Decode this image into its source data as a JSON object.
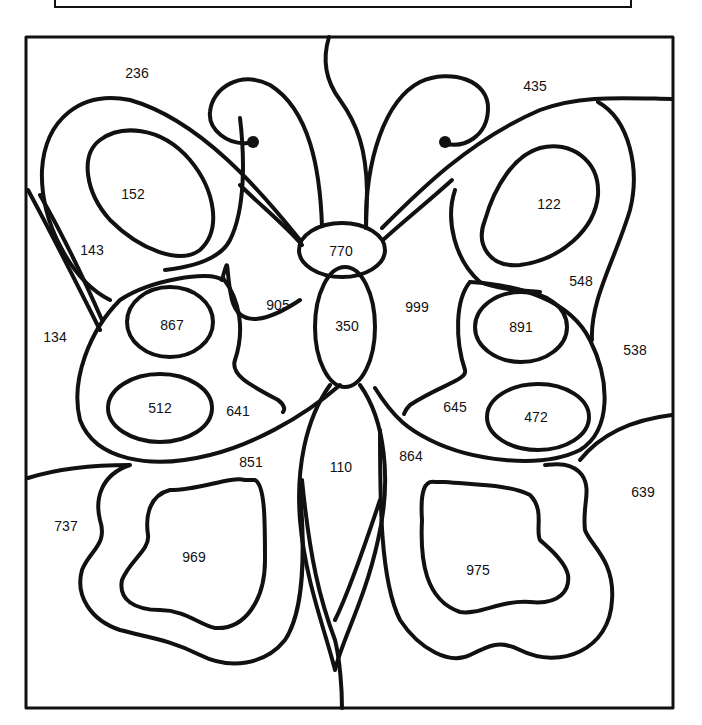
{
  "page": {
    "kind": "color-by-number worksheet"
  },
  "colors": {
    "line": "#111111",
    "background": "#ffffff"
  },
  "regions": [
    {
      "id": "r236",
      "label": "236",
      "area": "background-top-left",
      "x": 137,
      "y": 73
    },
    {
      "id": "r435",
      "label": "435",
      "area": "background-top-right",
      "x": 535,
      "y": 86
    },
    {
      "id": "r152",
      "label": "152",
      "area": "left-upper-wing-inner-oval",
      "x": 133,
      "y": 194
    },
    {
      "id": "r122",
      "label": "122",
      "area": "right-upper-wing-inner-oval",
      "x": 549,
      "y": 204
    },
    {
      "id": "r143",
      "label": "143",
      "area": "left-upper-wing-band",
      "x": 92,
      "y": 250
    },
    {
      "id": "r770",
      "label": "770",
      "area": "head",
      "x": 341,
      "y": 251
    },
    {
      "id": "r548",
      "label": "548",
      "area": "right-upper-wing-band",
      "x": 581,
      "y": 281
    },
    {
      "id": "r905",
      "label": "905",
      "area": "background-left-of-body",
      "x": 278,
      "y": 305
    },
    {
      "id": "r999",
      "label": "999",
      "area": "background-right-of-body",
      "x": 417,
      "y": 307
    },
    {
      "id": "r134",
      "label": "134",
      "area": "background-left-edge",
      "x": 55,
      "y": 337
    },
    {
      "id": "r867",
      "label": "867",
      "area": "left-lower-wing-top-oval",
      "x": 172,
      "y": 325
    },
    {
      "id": "r350",
      "label": "350",
      "area": "thorax",
      "x": 347,
      "y": 326
    },
    {
      "id": "r891",
      "label": "891",
      "area": "right-lower-wing-top-oval",
      "x": 521,
      "y": 327
    },
    {
      "id": "r538",
      "label": "538",
      "area": "background-right-edge",
      "x": 635,
      "y": 350
    },
    {
      "id": "r512",
      "label": "512",
      "area": "left-lower-wing-bottom-oval",
      "x": 160,
      "y": 408
    },
    {
      "id": "r641",
      "label": "641",
      "area": "left-lower-wing-band",
      "x": 238,
      "y": 411
    },
    {
      "id": "r645",
      "label": "645",
      "area": "right-lower-wing-band",
      "x": 455,
      "y": 407
    },
    {
      "id": "r472",
      "label": "472",
      "area": "right-lower-wing-bottom-oval",
      "x": 536,
      "y": 417
    },
    {
      "id": "r851",
      "label": "851",
      "area": "left-tail-wing-band",
      "x": 251,
      "y": 462
    },
    {
      "id": "r110",
      "label": "110",
      "area": "abdomen",
      "x": 341,
      "y": 467
    },
    {
      "id": "r864",
      "label": "864",
      "area": "right-tail-wing-band",
      "x": 411,
      "y": 456
    },
    {
      "id": "r639",
      "label": "639",
      "area": "background-bottom-right",
      "x": 643,
      "y": 492
    },
    {
      "id": "r737",
      "label": "737",
      "area": "background-bottom-left",
      "x": 66,
      "y": 526
    },
    {
      "id": "r969",
      "label": "969",
      "area": "left-tail-wing-inner",
      "x": 194,
      "y": 557
    },
    {
      "id": "r975",
      "label": "975",
      "area": "right-tail-wing-inner",
      "x": 478,
      "y": 570
    }
  ]
}
